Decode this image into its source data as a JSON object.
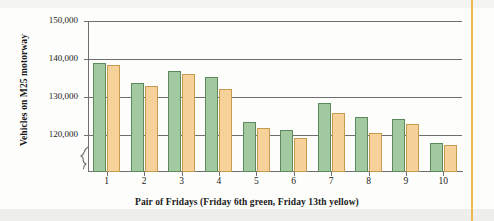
{
  "chart_data": {
    "type": "bar",
    "title": "",
    "xlabel": "Pair of Fridays (Friday 6th green, Friday 13th yellow)",
    "ylabel": "Vehicles on M25 motorway",
    "categories": [
      "1",
      "2",
      "3",
      "4",
      "5",
      "6",
      "7",
      "8",
      "9",
      "10"
    ],
    "series": [
      {
        "name": "Friday 6th green",
        "color": "#a3c9a1",
        "values": [
          139000,
          133700,
          136800,
          135200,
          123500,
          121300,
          128400,
          124700,
          124200,
          117800
        ]
      },
      {
        "name": "Friday 13th yellow",
        "color": "#f6d29a",
        "values": [
          138500,
          132800,
          136000,
          132000,
          121800,
          119100,
          125900,
          120400,
          122900,
          117400
        ]
      }
    ],
    "ytick_labels": [
      "150,000",
      "140,000",
      "130,000",
      "120,000"
    ],
    "ytick_values": [
      150000,
      140000,
      130000,
      120000
    ],
    "ylim": [
      113500,
      150000
    ],
    "y_axis_break": true,
    "grid": true,
    "legend": "encoded in x-axis label",
    "bar_border_green": "#5d8a5c",
    "bar_border_yellow": "#c79a4e",
    "axis_color": "#6f6f6f"
  },
  "page": {
    "right_rule_color": "#f0b653"
  }
}
